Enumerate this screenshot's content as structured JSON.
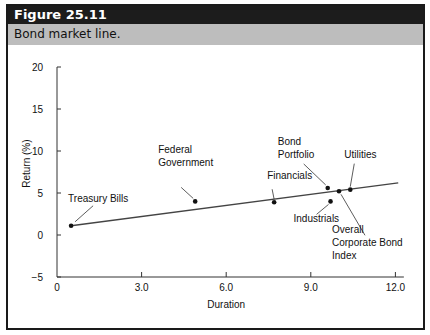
{
  "figure": {
    "label": "Figure 25.11",
    "caption": "Bond market line."
  },
  "chart_data": {
    "type": "scatter",
    "title": "Bond market line.",
    "xlabel": "Duration",
    "ylabel": "Return (%)",
    "xlim": [
      0,
      12.3
    ],
    "ylim": [
      -5,
      20
    ],
    "xticks": [
      0,
      3.0,
      6.0,
      9.0,
      12.0
    ],
    "xtick_labels": [
      "0",
      "3.0",
      "6.0",
      "9.0",
      "12.0"
    ],
    "yticks": [
      -5,
      0,
      5,
      10,
      15,
      20
    ],
    "ytick_labels": [
      "−5",
      "0",
      "5",
      "10",
      "15",
      "20"
    ],
    "grid": false,
    "legend": "none",
    "line": {
      "name": "Bond market line",
      "x": [
        0.5,
        12.1
      ],
      "y": [
        1.1,
        6.2
      ]
    },
    "points": [
      {
        "name": "Treasury Bills",
        "x": 0.5,
        "y": 1.1,
        "label_lines": [
          "Treasury Bills"
        ]
      },
      {
        "name": "Federal Government",
        "x": 4.9,
        "y": 4.0,
        "label_lines": [
          "Federal",
          "Government"
        ]
      },
      {
        "name": "Financials",
        "x": 7.7,
        "y": 3.9,
        "label_lines": [
          "Financials"
        ]
      },
      {
        "name": "Bond Portfolio",
        "x": 9.6,
        "y": 5.6,
        "label_lines": [
          "Bond",
          "Portfolio"
        ]
      },
      {
        "name": "Overall Corporate Bond Index",
        "x": 10.0,
        "y": 5.2,
        "label_lines": [
          "Overall",
          "Corporate Bond",
          "Index"
        ]
      },
      {
        "name": "Utilities",
        "x": 10.4,
        "y": 5.4,
        "label_lines": [
          "Utilities"
        ]
      },
      {
        "name": "Industrials",
        "x": 9.7,
        "y": 4.0,
        "label_lines": [
          "Industrials"
        ]
      }
    ]
  }
}
